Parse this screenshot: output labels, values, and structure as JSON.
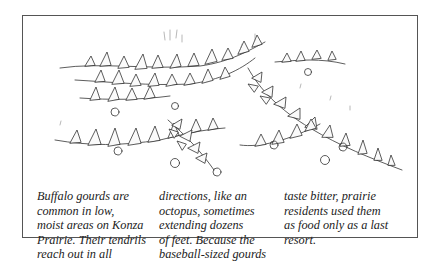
{
  "figure": {
    "illustration": {
      "subject": "Buffalo gourd vines sprawling across prairie ground",
      "style": "pen-and-ink line drawing"
    },
    "caption": {
      "columns": [
        {
          "lines": [
            "Buffalo gourds are",
            "common in low,",
            "moist areas on Konza",
            "Prairie. Their tendrils",
            "reach out in all"
          ]
        },
        {
          "lines": [
            "directions, like an",
            "octopus, sometimes",
            "extending dozens",
            "of feet. Because the",
            "baseball-sized gourds"
          ]
        },
        {
          "lines": [
            "taste bitter, prairie",
            "residents used them",
            "as food only as a last",
            "resort."
          ]
        }
      ]
    }
  }
}
